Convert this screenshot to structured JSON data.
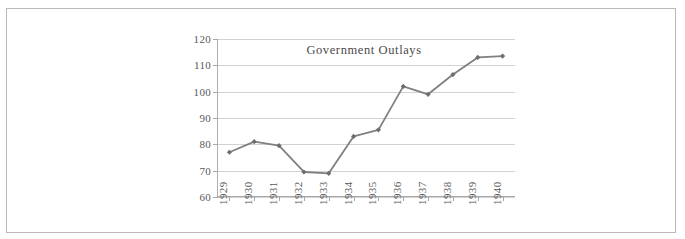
{
  "chart_data": {
    "type": "line",
    "title": "Government Outlays",
    "xlabel": "",
    "ylabel": "",
    "categories": [
      "1929",
      "1930",
      "1931",
      "1932",
      "1933",
      "1934",
      "1935",
      "1936",
      "1937",
      "1938",
      "1939",
      "1940"
    ],
    "values": [
      77,
      81,
      79.5,
      69.5,
      69,
      83,
      85.5,
      102,
      99,
      106.5,
      113,
      113.5
    ],
    "series": [
      {
        "name": "Government Outlays",
        "values": [
          77,
          81,
          79.5,
          69.5,
          69,
          83,
          85.5,
          102,
          99,
          106.5,
          113,
          113.5
        ]
      }
    ],
    "ylim": [
      60,
      120
    ],
    "yticks": [
      60,
      70,
      80,
      90,
      100,
      110,
      120
    ],
    "ytick_labels": [
      "60",
      "70",
      "80",
      "90",
      "100",
      "110",
      "120"
    ],
    "grid": "horizontal",
    "legend": "none",
    "marker": "diamond",
    "line_color": "#808080",
    "marker_color": "#6e6e6e",
    "gridline_color": "#d2d2d2",
    "axis_color": "#a8a8a8",
    "text_color": "#595959",
    "title_color": "#4a4a4a",
    "frame_color": "#b9b9b9",
    "background": "#ffffff"
  }
}
